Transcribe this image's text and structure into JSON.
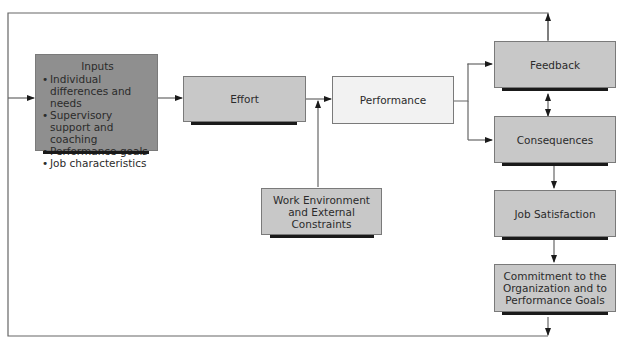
{
  "diagram": {
    "type": "flowchart",
    "nodes": {
      "inputs": {
        "title": "Inputs",
        "items": [
          "Individual differences and needs",
          "Supervisory support and coaching",
          "Performance goals",
          "Job characteristics"
        ]
      },
      "effort": {
        "label": "Effort"
      },
      "performance": {
        "label": "Performance"
      },
      "work_environment": {
        "label": "Work Environment and External Constraints"
      },
      "feedback": {
        "label": "Feedback"
      },
      "consequences": {
        "label": "Consequences"
      },
      "job_satisfaction": {
        "label": "Job Satisfaction"
      },
      "commitment": {
        "label": "Commitment to the Organization and to Performance Goals"
      }
    },
    "edges": [
      [
        "loop-entry",
        "inputs"
      ],
      [
        "inputs",
        "effort"
      ],
      [
        "effort",
        "performance"
      ],
      [
        "work_environment",
        "performance"
      ],
      [
        "performance",
        "feedback"
      ],
      [
        "performance",
        "consequences"
      ],
      [
        "feedback",
        "consequences",
        "bidirectional"
      ],
      [
        "consequences",
        "job_satisfaction"
      ],
      [
        "job_satisfaction",
        "commitment"
      ],
      [
        "feedback",
        "loop-top"
      ],
      [
        "commitment",
        "loop-bottom"
      ]
    ],
    "colors": {
      "inputs_fill": "#8f8f8f",
      "box_fill": "#c8c8c8",
      "performance_fill": "#f2f2f2",
      "shadow": "#1a1a1a",
      "line": "#555555"
    }
  }
}
